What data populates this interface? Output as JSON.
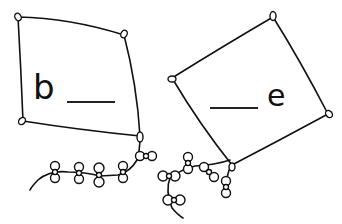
{
  "worksheet": {
    "kites": [
      {
        "letter": "b",
        "blank_position": "after"
      },
      {
        "letter": "e",
        "blank_position": "before"
      }
    ]
  },
  "colors": {
    "ink": "#111111",
    "paper": "#ffffff"
  }
}
